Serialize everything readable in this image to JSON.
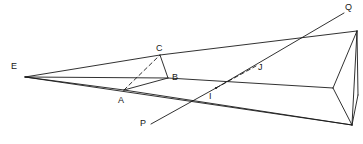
{
  "figure": {
    "kind": "geometric-line-diagram",
    "width": 363,
    "height": 144,
    "background_color": "#ffffff",
    "stroke_color": "#1a1a1a",
    "label_color": "#171717",
    "solid_stroke_width": 0.9,
    "dashed_stroke_width": 0.9,
    "dash_pattern": "4,3"
  },
  "labels": [
    {
      "id": "E",
      "text": "E",
      "x": 11,
      "y": 62
    },
    {
      "id": "C",
      "text": "C",
      "x": 156,
      "y": 44
    },
    {
      "id": "B",
      "text": "B",
      "x": 172,
      "y": 73
    },
    {
      "id": "A",
      "text": "A",
      "x": 118,
      "y": 96
    },
    {
      "id": "I",
      "text": "I",
      "x": 209,
      "y": 92
    },
    {
      "id": "J",
      "text": "J",
      "x": 258,
      "y": 63
    },
    {
      "id": "P",
      "text": "P",
      "x": 140,
      "y": 119
    },
    {
      "id": "Q",
      "text": "Q",
      "x": 345,
      "y": 3
    }
  ],
  "points": {
    "E": {
      "x": 25,
      "y": 77
    },
    "C": {
      "x": 160,
      "y": 55
    },
    "B": {
      "x": 168,
      "y": 78
    },
    "A": {
      "x": 124,
      "y": 90
    },
    "I": {
      "x": 216,
      "y": 88
    },
    "J": {
      "x": 256,
      "y": 66
    },
    "P": {
      "x": 151,
      "y": 124
    },
    "Q": {
      "x": 344,
      "y": 13
    },
    "R1": {
      "x": 357,
      "y": 31
    },
    "R2": {
      "x": 333,
      "y": 88
    },
    "R3": {
      "x": 352,
      "y": 125
    },
    "R4": {
      "x": 358,
      "y": 95
    }
  },
  "solid_segments": [
    {
      "name": "edge-E-C-R1",
      "from": "E",
      "to": "R1",
      "via": "C"
    },
    {
      "name": "edge-E-B-R2",
      "from": "E",
      "to": "R2",
      "via": "B"
    },
    {
      "name": "edge-E-A",
      "from": "E",
      "to": "A"
    },
    {
      "name": "edge-A-B",
      "from": "A",
      "to": "B"
    },
    {
      "name": "edge-C-B",
      "from": "C",
      "to": "B"
    },
    {
      "name": "edge-E-R3",
      "from": "E",
      "to": "R3"
    },
    {
      "name": "edge-A-R3",
      "from": "A",
      "to": "R3"
    },
    {
      "name": "edge-P-I",
      "from": "P",
      "to": "I"
    },
    {
      "name": "edge-I-Q",
      "from": "I",
      "to": "Q"
    },
    {
      "name": "edge-R1-R2",
      "from": "R1",
      "to": "R2"
    },
    {
      "name": "edge-R1-R3",
      "from": "R1",
      "to": "R3"
    },
    {
      "name": "edge-R2-R3",
      "from": "R2",
      "to": "R3"
    },
    {
      "name": "edge-R1-R4",
      "from": "R1",
      "to": "R4"
    },
    {
      "name": "edge-R4-R3",
      "from": "R4",
      "to": "R3"
    }
  ],
  "dashed_segments": [
    {
      "name": "dashed-A-C",
      "from": "A",
      "to": "C"
    },
    {
      "name": "dashed-I-J",
      "from": "I",
      "to": "J"
    }
  ]
}
